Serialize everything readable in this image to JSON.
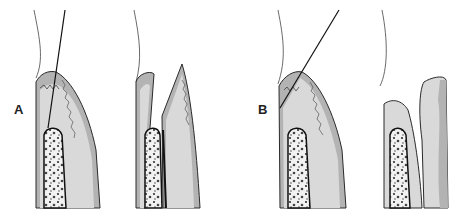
{
  "figure": {
    "panels": [
      {
        "label": "A",
        "description": "Internal bevel incision and resulting flap"
      },
      {
        "label": "B",
        "description": "Gingivectomy-type external bevel incision and result"
      }
    ]
  },
  "colors": {
    "gingiva": "#d9d9d9",
    "epithelium": "#b3b3b3",
    "outline": "#2a2a2a",
    "bone": "#f2f2f2",
    "background": "#ffffff"
  }
}
